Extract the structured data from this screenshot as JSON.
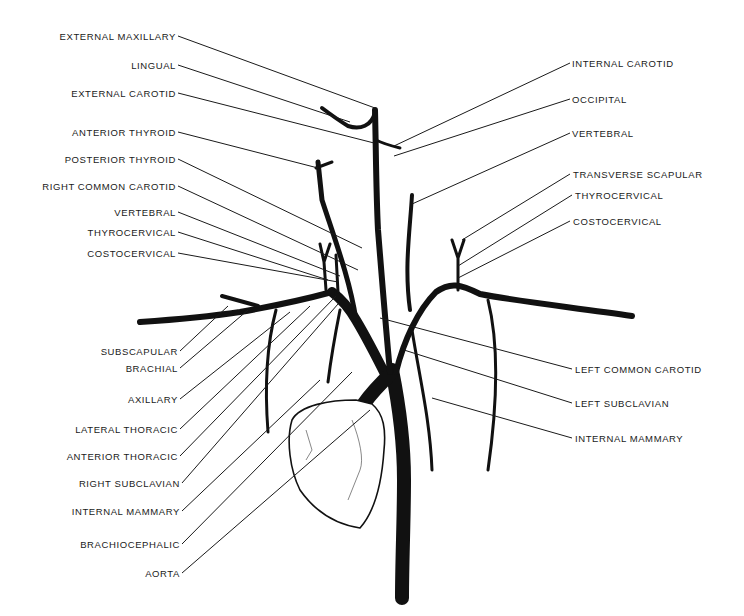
{
  "figure": {
    "title": "",
    "colors": {
      "background": "#ffffff",
      "ink": "#111111"
    }
  },
  "labels": {
    "left": [
      {
        "text": "EXTERNAL MAXILLARY",
        "x": 176,
        "y": 36
      },
      {
        "text": "LINGUAL",
        "x": 176,
        "y": 65
      },
      {
        "text": "EXTERNAL CAROTID",
        "x": 176,
        "y": 93
      },
      {
        "text": "ANTERIOR THYROID",
        "x": 176,
        "y": 132
      },
      {
        "text": "POSTERIOR THYROID",
        "x": 176,
        "y": 159
      },
      {
        "text": "RIGHT COMMON CAROTID",
        "x": 176,
        "y": 186
      },
      {
        "text": "VERTEBRAL",
        "x": 176,
        "y": 212
      },
      {
        "text": "THYROCERVICAL",
        "x": 176,
        "y": 232
      },
      {
        "text": "COSTOCERVICAL",
        "x": 176,
        "y": 253
      },
      {
        "text": "SUBSCAPULAR",
        "x": 178,
        "y": 351
      },
      {
        "text": "BRACHIAL",
        "x": 178,
        "y": 368
      },
      {
        "text": "AXILLARY",
        "x": 178,
        "y": 399
      },
      {
        "text": "LATERAL THORACIC",
        "x": 178,
        "y": 429
      },
      {
        "text": "ANTERIOR THORACIC",
        "x": 178,
        "y": 456
      },
      {
        "text": "RIGHT SUBCLAVIAN",
        "x": 180,
        "y": 483
      },
      {
        "text": "INTERNAL MAMMARY",
        "x": 180,
        "y": 511
      },
      {
        "text": "BRACHIOCEPHALIC",
        "x": 180,
        "y": 544
      },
      {
        "text": "AORTA",
        "x": 180,
        "y": 573
      }
    ],
    "right": [
      {
        "text": "INTERNAL CAROTID",
        "x": 572,
        "y": 63
      },
      {
        "text": "OCCIPITAL",
        "x": 572,
        "y": 99
      },
      {
        "text": "VERTEBRAL",
        "x": 572,
        "y": 133
      },
      {
        "text": "TRANSVERSE SCAPULAR",
        "x": 573,
        "y": 174
      },
      {
        "text": "THYROCERVICAL",
        "x": 575,
        "y": 195
      },
      {
        "text": "COSTOCERVICAL",
        "x": 573,
        "y": 221
      },
      {
        "text": "LEFT COMMON CAROTID",
        "x": 575,
        "y": 369
      },
      {
        "text": "LEFT SUBCLAVIAN",
        "x": 575,
        "y": 403
      },
      {
        "text": "INTERNAL MAMMARY",
        "x": 575,
        "y": 438
      }
    ]
  }
}
